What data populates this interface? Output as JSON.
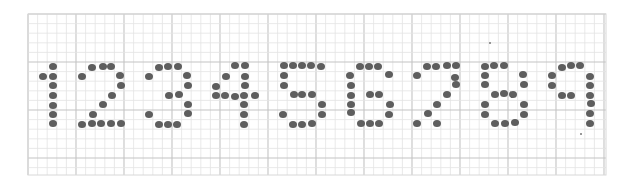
{
  "image": {
    "description": "Dot-matrix digits 1 through 9 drawn with gray dots on graph paper",
    "digits_text": "123456789",
    "grid": {
      "left": 28,
      "top": 14,
      "right": 606,
      "bottom": 175,
      "cell": 9.6,
      "major_every": 5,
      "minor_color": "#e3e3e3",
      "major_color": "#c4c4c4",
      "border_color": "#d8d8d8"
    },
    "dot_color": "#5e5e5e",
    "digits": [
      {
        "label": "1",
        "dots": [
          [
            43,
            76
          ],
          [
            53,
            66
          ],
          [
            53,
            76
          ],
          [
            53,
            85
          ],
          [
            53,
            95
          ],
          [
            53,
            105
          ],
          [
            53,
            114
          ],
          [
            53,
            123
          ]
        ]
      },
      {
        "label": "2",
        "dots": [
          [
            82,
            76
          ],
          [
            92,
            67
          ],
          [
            103,
            66
          ],
          [
            111,
            66
          ],
          [
            120,
            75
          ],
          [
            121,
            85
          ],
          [
            112,
            95
          ],
          [
            103,
            104
          ],
          [
            93,
            114
          ],
          [
            82,
            124
          ],
          [
            92,
            123
          ],
          [
            101,
            123
          ],
          [
            111,
            123
          ],
          [
            121,
            123
          ]
        ]
      },
      {
        "label": "3",
        "dots": [
          [
            149,
            76
          ],
          [
            159,
            67
          ],
          [
            168,
            66
          ],
          [
            178,
            66
          ],
          [
            187,
            75
          ],
          [
            188,
            85
          ],
          [
            179,
            94
          ],
          [
            169,
            95
          ],
          [
            188,
            104
          ],
          [
            188,
            113
          ],
          [
            149,
            114
          ],
          [
            159,
            124
          ],
          [
            168,
            124
          ],
          [
            177,
            124
          ]
        ]
      },
      {
        "label": "4",
        "dots": [
          [
            235,
            65
          ],
          [
            245,
            65
          ],
          [
            226,
            76
          ],
          [
            216,
            86
          ],
          [
            216,
            95
          ],
          [
            225,
            95
          ],
          [
            235,
            96
          ],
          [
            244,
            95
          ],
          [
            255,
            95
          ],
          [
            245,
            76
          ],
          [
            245,
            85
          ],
          [
            244,
            104
          ],
          [
            244,
            114
          ],
          [
            244,
            124
          ]
        ]
      },
      {
        "label": "5",
        "dots": [
          [
            284,
            65
          ],
          [
            293,
            65
          ],
          [
            302,
            65
          ],
          [
            311,
            65
          ],
          [
            321,
            66
          ],
          [
            284,
            75
          ],
          [
            284,
            85
          ],
          [
            294,
            94
          ],
          [
            302,
            94
          ],
          [
            312,
            94
          ],
          [
            322,
            104
          ],
          [
            322,
            114
          ],
          [
            283,
            114
          ],
          [
            293,
            124
          ],
          [
            302,
            124
          ],
          [
            312,
            123
          ]
        ]
      },
      {
        "label": "6",
        "dots": [
          [
            360,
            66
          ],
          [
            369,
            66
          ],
          [
            378,
            66
          ],
          [
            389,
            74
          ],
          [
            350,
            75
          ],
          [
            351,
            85
          ],
          [
            351,
            95
          ],
          [
            351,
            104
          ],
          [
            351,
            112
          ],
          [
            370,
            94
          ],
          [
            379,
            94
          ],
          [
            390,
            104
          ],
          [
            389,
            114
          ],
          [
            361,
            123
          ],
          [
            370,
            123
          ],
          [
            379,
            123
          ]
        ]
      },
      {
        "label": "7",
        "dots": [
          [
            417,
            75
          ],
          [
            427,
            66
          ],
          [
            436,
            66
          ],
          [
            447,
            65
          ],
          [
            456,
            65
          ],
          [
            455,
            77
          ],
          [
            456,
            84
          ],
          [
            447,
            94
          ],
          [
            437,
            104
          ],
          [
            428,
            113
          ],
          [
            417,
            123
          ],
          [
            437,
            123
          ]
        ]
      },
      {
        "label": "8",
        "dots": [
          [
            485,
            66
          ],
          [
            494,
            65
          ],
          [
            504,
            65
          ],
          [
            485,
            75
          ],
          [
            485,
            84
          ],
          [
            523,
            74
          ],
          [
            524,
            84
          ],
          [
            495,
            94
          ],
          [
            504,
            93
          ],
          [
            513,
            94
          ],
          [
            485,
            104
          ],
          [
            485,
            114
          ],
          [
            524,
            104
          ],
          [
            524,
            114
          ],
          [
            495,
            123
          ],
          [
            505,
            123
          ],
          [
            515,
            122
          ]
        ]
      },
      {
        "label": "9",
        "dots": [
          [
            562,
            67
          ],
          [
            571,
            65
          ],
          [
            580,
            65
          ],
          [
            552,
            75
          ],
          [
            552,
            85
          ],
          [
            562,
            95
          ],
          [
            571,
            95
          ],
          [
            590,
            76
          ],
          [
            590,
            85
          ],
          [
            590,
            95
          ],
          [
            591,
            103
          ],
          [
            590,
            113
          ],
          [
            590,
            123
          ]
        ]
      }
    ],
    "specks": [
      [
        490,
        43
      ],
      [
        581,
        134
      ]
    ]
  }
}
